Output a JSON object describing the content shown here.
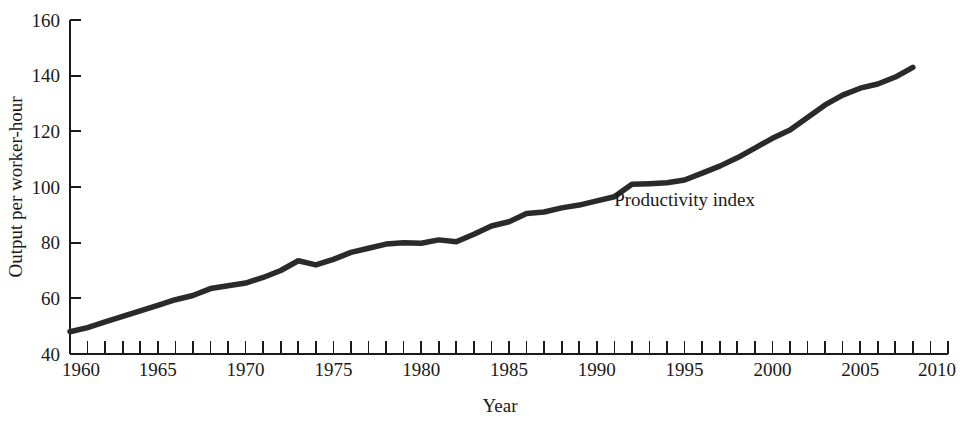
{
  "chart_data": {
    "type": "line",
    "title": "",
    "xlabel": "Year",
    "ylabel": "Output per worker-hour",
    "xlim": [
      1960,
      2010
    ],
    "ylim": [
      40,
      160
    ],
    "grid": false,
    "legend": "inline-annotation",
    "x_tick_labels": [
      "1960",
      "1965",
      "1970",
      "1975",
      "1980",
      "1985",
      "1990",
      "1995",
      "2000",
      "2005",
      "2010"
    ],
    "x_tick_values": [
      1960,
      1965,
      1970,
      1975,
      1980,
      1985,
      1990,
      1995,
      2000,
      2005,
      2010
    ],
    "x_minor_tick_step": 1,
    "y_tick_labels": [
      "40",
      "60",
      "80",
      "100",
      "120",
      "140",
      "160"
    ],
    "y_tick_values": [
      40,
      60,
      80,
      100,
      120,
      140,
      160
    ],
    "line_color": "#2a2a2a",
    "line_width": 5.5,
    "series": [
      {
        "name": "Productivity index",
        "annotation_label": "Productivity index",
        "annotation_x": 1995,
        "annotation_y": 93,
        "x": [
          1960,
          1961,
          1962,
          1963,
          1964,
          1965,
          1966,
          1967,
          1968,
          1969,
          1970,
          1971,
          1972,
          1973,
          1974,
          1975,
          1976,
          1977,
          1978,
          1979,
          1980,
          1981,
          1982,
          1983,
          1984,
          1985,
          1986,
          1987,
          1988,
          1989,
          1990,
          1991,
          1992,
          1993,
          1994,
          1995,
          1996,
          1997,
          1998,
          1999,
          2000,
          2001,
          2002,
          2003,
          2004,
          2005,
          2006,
          2007,
          2008
        ],
        "values": [
          48.0,
          49.5,
          51.5,
          53.5,
          55.5,
          57.5,
          59.5,
          61.0,
          63.5,
          64.5,
          65.5,
          67.5,
          70.0,
          73.5,
          72.0,
          74.0,
          76.5,
          78.0,
          79.5,
          80.0,
          79.8,
          81.0,
          80.3,
          83.0,
          86.0,
          87.5,
          90.5,
          91.0,
          92.5,
          93.5,
          95.0,
          96.5,
          101.0,
          101.2,
          101.5,
          102.5,
          105.0,
          107.5,
          110.5,
          114.0,
          117.5,
          120.5,
          125.0,
          129.5,
          133.0,
          135.5,
          137.0,
          139.5,
          143.0
        ]
      }
    ]
  },
  "axis": {
    "y_label": "Output per worker-hour",
    "x_label": "Year"
  }
}
